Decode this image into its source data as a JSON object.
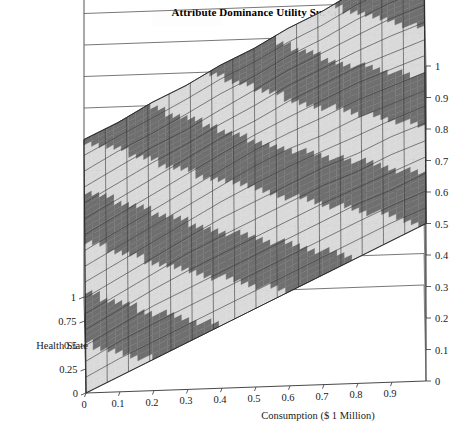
{
  "figure": {
    "title": "Attribute Dominance Utility Surface",
    "caption_partial": ""
  },
  "chart_data": {
    "type": "surface",
    "title": "Attribute Dominance Utility Surface",
    "xlabel": "Consumption ($ 1 Million)",
    "ylabel": "Health State",
    "zlabel": "",
    "xlim": [
      0,
      1
    ],
    "ylim": [
      0,
      1
    ],
    "zlim": [
      0,
      1
    ],
    "grid": true,
    "legend": "none",
    "projection": "3d-surface-contour-bands",
    "xticks": [
      "0",
      "0.1",
      "0.2",
      "0.3",
      "0.4",
      "0.5",
      "0.6",
      "0.7",
      "0.8",
      "0.9"
    ],
    "xtick_values": [
      0,
      0.1,
      0.2,
      0.3,
      0.4,
      0.5,
      0.6,
      0.7,
      0.8,
      0.9
    ],
    "yticks": [
      "1",
      "0.75",
      "0.5",
      "0.25",
      "0"
    ],
    "ytick_values": [
      1,
      0.75,
      0.5,
      0.25,
      0
    ],
    "zticks": [
      "0",
      "0.1",
      "0.2",
      "0.3",
      "0.4",
      "0.5",
      "0.6",
      "0.7",
      "0.8",
      "0.9",
      "1"
    ],
    "ztick_values": [
      0,
      0.1,
      0.2,
      0.3,
      0.4,
      0.5,
      0.6,
      0.7,
      0.8,
      0.9,
      1
    ],
    "band_count": 10,
    "band_interval": 0.1,
    "band_colors_dark": "#6f6f6f",
    "band_colors_light": "#d9d9d9",
    "mesh_color": "#3a3a3a",
    "surface": {
      "x": [
        0,
        0.1,
        0.2,
        0.3,
        0.4,
        0.5,
        0.6,
        0.7,
        0.8,
        0.9,
        1
      ],
      "y": [
        0,
        0.1,
        0.2,
        0.3,
        0.4,
        0.5,
        0.6,
        0.7,
        0.8,
        0.9,
        1
      ],
      "z": [
        [
          0.0,
          0.05,
          0.1,
          0.15,
          0.2,
          0.25,
          0.3,
          0.35,
          0.4,
          0.45,
          0.5
        ],
        [
          0.05,
          0.11,
          0.16,
          0.21,
          0.26,
          0.31,
          0.36,
          0.41,
          0.46,
          0.51,
          0.55
        ],
        [
          0.1,
          0.16,
          0.22,
          0.27,
          0.32,
          0.37,
          0.42,
          0.47,
          0.52,
          0.56,
          0.61
        ],
        [
          0.15,
          0.21,
          0.27,
          0.33,
          0.38,
          0.43,
          0.48,
          0.53,
          0.57,
          0.62,
          0.66
        ],
        [
          0.2,
          0.26,
          0.32,
          0.38,
          0.44,
          0.49,
          0.54,
          0.59,
          0.63,
          0.68,
          0.72
        ],
        [
          0.25,
          0.31,
          0.37,
          0.43,
          0.49,
          0.55,
          0.6,
          0.64,
          0.69,
          0.73,
          0.77
        ],
        [
          0.3,
          0.36,
          0.42,
          0.48,
          0.54,
          0.6,
          0.65,
          0.7,
          0.75,
          0.79,
          0.83
        ],
        [
          0.35,
          0.41,
          0.47,
          0.53,
          0.59,
          0.64,
          0.7,
          0.75,
          0.8,
          0.84,
          0.88
        ],
        [
          0.4,
          0.46,
          0.52,
          0.57,
          0.63,
          0.69,
          0.75,
          0.8,
          0.85,
          0.9,
          0.94
        ],
        [
          0.45,
          0.51,
          0.56,
          0.62,
          0.68,
          0.73,
          0.79,
          0.84,
          0.9,
          0.95,
          0.99
        ],
        [
          0.5,
          0.55,
          0.61,
          0.66,
          0.72,
          0.77,
          0.83,
          0.88,
          0.94,
          0.99,
          1.0
        ]
      ]
    }
  },
  "axes": {
    "x": {
      "label": "Consumption ($ 1 Million)",
      "ticks": [
        "0",
        "0.1",
        "0.2",
        "0.3",
        "0.4",
        "0.5",
        "0.6",
        "0.7",
        "0.8",
        "0.9"
      ]
    },
    "y": {
      "label": "Health State",
      "ticks": [
        "1",
        "0.75",
        "0.5",
        "0.25",
        "0"
      ]
    },
    "z": {
      "label": "",
      "ticks": [
        "1",
        "0.9",
        "0.8",
        "0.7",
        "0.6",
        "0.5",
        "0.4",
        "0.3",
        "0.2",
        "0.1",
        "0"
      ]
    }
  }
}
